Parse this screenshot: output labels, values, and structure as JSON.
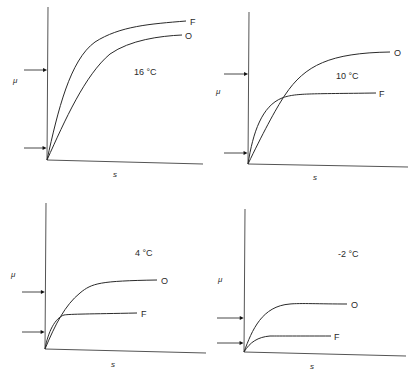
{
  "figure": {
    "background": "#ffffff",
    "ink": "#2a2a2a",
    "axis_color": "#555555"
  },
  "chart_data": [
    {
      "type": "line",
      "title": "16 °C",
      "xlabel": "s",
      "ylabel": "μ",
      "grid": false,
      "legend": "curve-end labels",
      "series": [
        {
          "name": "F",
          "shape": "saturating",
          "description": "rises steeply, higher plateau",
          "plateau_rel": 0.9
        },
        {
          "name": "O",
          "shape": "saturating",
          "description": "rises more slowly, lower plateau",
          "plateau_rel": 0.82
        }
      ],
      "arrows": {
        "upper_rel": 0.58,
        "lower_rel": 0.08
      },
      "crossing": false
    },
    {
      "type": "line",
      "title": "10 °C",
      "xlabel": "s",
      "ylabel": "μ",
      "grid": false,
      "legend": "curve-end labels",
      "series": [
        {
          "name": "O",
          "shape": "saturating",
          "description": "rises linearly then plateaus high",
          "plateau_rel": 0.75
        },
        {
          "name": "F",
          "shape": "saturating",
          "description": "rises fast then plateaus early, lower",
          "plateau_rel": 0.46
        }
      ],
      "arrows": {
        "upper_rel": 0.59,
        "lower_rel": 0.07
      },
      "crossing": true
    },
    {
      "type": "line",
      "title": "4 °C",
      "xlabel": "s",
      "ylabel": "μ",
      "grid": false,
      "legend": "curve-end labels",
      "series": [
        {
          "name": "O",
          "shape": "saturating",
          "description": "plateau mid-height",
          "plateau_rel": 0.47
        },
        {
          "name": "F",
          "shape": "saturating",
          "description": "low early plateau",
          "plateau_rel": 0.24
        }
      ],
      "arrows": {
        "upper_rel": 0.39,
        "lower_rel": 0.12
      },
      "crossing": true
    },
    {
      "type": "line",
      "title": "-2 °C",
      "xlabel": "s",
      "ylabel": "μ",
      "grid": false,
      "legend": "curve-end labels",
      "series": [
        {
          "name": "O",
          "shape": "saturating",
          "description": "low plateau",
          "plateau_rel": 0.32
        },
        {
          "name": "F",
          "shape": "saturating",
          "description": "very low plateau",
          "plateau_rel": 0.11
        }
      ],
      "arrows": {
        "upper_rel": 0.23,
        "lower_rel": 0.06
      },
      "crossing": false
    }
  ],
  "panels": [
    {
      "temp": "16 °C",
      "ylabel": "μ",
      "xlabel": "s",
      "origin": [
        47,
        160
      ],
      "yaxis_top": [
        48,
        7
      ],
      "xaxis_end": [
        203,
        164
      ],
      "arrows_y": [
        70,
        148
      ],
      "arrow_x0": 24,
      "temp_pos": [
        134,
        75
      ],
      "ylabel_pos": [
        13,
        83
      ],
      "xlabel_pos": [
        113,
        177
      ],
      "curves": [
        {
          "name": "F",
          "d": "M47,160 C58,110 70,60 95,42 C120,26 150,24 186,21",
          "label_pos": [
            190,
            25
          ]
        },
        {
          "name": "O",
          "d": "M47,160 C65,120 85,75 110,54 C130,40 160,36 182,35",
          "label_pos": [
            185,
            39
          ]
        }
      ]
    },
    {
      "temp": "10 °C",
      "ylabel": "μ",
      "xlabel": "s",
      "origin": [
        248,
        164
      ],
      "yaxis_top": [
        249,
        12
      ],
      "xaxis_end": [
        408,
        167
      ],
      "arrows_y": [
        74,
        153
      ],
      "arrow_x0": 224,
      "temp_pos": [
        336,
        79
      ],
      "ylabel_pos": [
        216,
        94
      ],
      "xlabel_pos": [
        313,
        180
      ],
      "curves": [
        {
          "name": "O",
          "d": "M248,164 C262,135 275,110 285,95 C305,65 330,53 390,52",
          "label_pos": [
            394,
            56
          ]
        },
        {
          "name": "F",
          "d": "M248,164 C253,132 262,106 282,98 C295,93 310,94 376,93",
          "label_pos": [
            379,
            97
          ]
        }
      ]
    },
    {
      "temp": "4 °C",
      "ylabel": "μ",
      "xlabel": "s",
      "origin": [
        45,
        349
      ],
      "yaxis_top": [
        46,
        203
      ],
      "xaxis_end": [
        206,
        353
      ],
      "arrows_y": [
        292,
        332
      ],
      "arrow_x0": 22,
      "temp_pos": [
        135,
        256
      ],
      "ylabel_pos": [
        11,
        277
      ],
      "xlabel_pos": [
        111,
        367
      ],
      "curves": [
        {
          "name": "O",
          "d": "M45,349 C55,325 65,305 80,293 C92,283 100,281 157,280",
          "label_pos": [
            161,
            284
          ]
        },
        {
          "name": "F",
          "d": "M45,349 C48,332 55,318 64,315 C70,314 90,314 137,313",
          "label_pos": [
            141,
            317
          ]
        }
      ]
    },
    {
      "temp": "-2 °C",
      "ylabel": "μ",
      "xlabel": "s",
      "origin": [
        244,
        352
      ],
      "yaxis_top": [
        245,
        209
      ],
      "xaxis_end": [
        406,
        356
      ],
      "arrows_y": [
        318,
        343
      ],
      "arrow_x0": 217,
      "temp_pos": [
        338,
        257
      ],
      "ylabel_pos": [
        218,
        282
      ],
      "xlabel_pos": [
        310,
        369
      ],
      "curves": [
        {
          "name": "O",
          "d": "M244,352 C252,330 262,306 290,304 C300,303 320,304 347,304",
          "label_pos": [
            351,
            308
          ]
        },
        {
          "name": "F",
          "d": "M244,352 C250,342 258,337 270,336 C280,336 300,336 331,336",
          "label_pos": [
            334,
            340
          ]
        }
      ]
    }
  ]
}
